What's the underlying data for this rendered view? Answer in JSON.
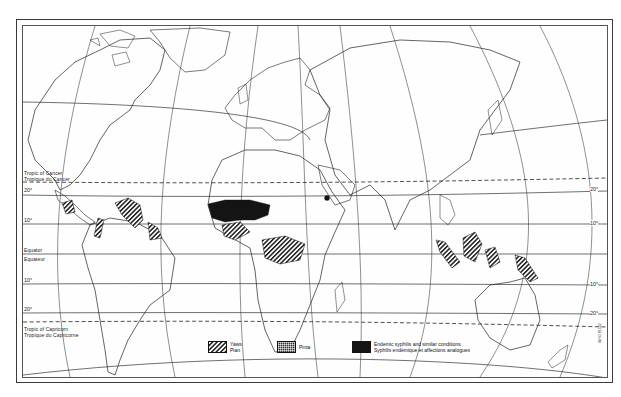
{
  "map": {
    "title": "",
    "latitude_lines": [
      {
        "name": "tropic-of-cancer",
        "label_en": "Tropic of Cancer",
        "label_fr": "Tropique du Cancer",
        "style": "dashed"
      },
      {
        "name": "lat-20n",
        "label": "20°"
      },
      {
        "name": "lat-10n",
        "label": "10°"
      },
      {
        "name": "equator",
        "label_en": "Equator",
        "label_fr": "Equateur"
      },
      {
        "name": "lat-10s",
        "label": "10°"
      },
      {
        "name": "lat-20s",
        "label": "20°"
      },
      {
        "name": "tropic-of-capricorn",
        "label_en": "Tropic of Capricorn",
        "label_fr": "Tropique du Capricorne",
        "style": "dashed"
      }
    ],
    "labels": {
      "cancer_en": "Tropic of Cancer",
      "cancer_fr": "Tropique du Cancer",
      "equator_en": "Equator",
      "equator_fr": "Equateur",
      "capricorn_en": "Tropic of Capricorn",
      "capricorn_fr": "Tropique du Capricorne",
      "deg20": "20°",
      "deg10": "10°"
    },
    "legend": [
      {
        "name": "yaws",
        "label_en": "Yaws",
        "label_fr": "Pian",
        "pattern": "diagonal-hatch"
      },
      {
        "name": "pinta",
        "label_en": "Pinta",
        "pattern": "fine-crosshatch"
      },
      {
        "name": "endemic-syphilis",
        "label_en": "Endemic syphilis and similar conditions",
        "label_fr": "Syphilis endémique et affections analogues",
        "pattern": "solid-black"
      }
    ],
    "code": "WHO 81542",
    "colors": {
      "ink": "#1a1a1a",
      "paper": "#ffffff",
      "fill_solid": "#141414"
    }
  }
}
